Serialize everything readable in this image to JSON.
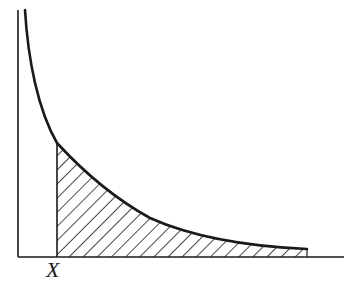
{
  "figure": {
    "type": "diagram",
    "labels": {
      "x_marker": "X"
    },
    "colors": {
      "ink": "#1a1a1a",
      "background": "#ffffff"
    },
    "axes": {
      "y_axis": {
        "x": 18,
        "y_top": 10,
        "y_bottom": 257
      },
      "x_axis": {
        "y": 257,
        "x_left": 18,
        "x_right": 344
      }
    },
    "marker_x_px": 57,
    "shaded_region": {
      "from_x": 57,
      "to_x": 307,
      "pattern": "diagonal-hatch"
    }
  }
}
